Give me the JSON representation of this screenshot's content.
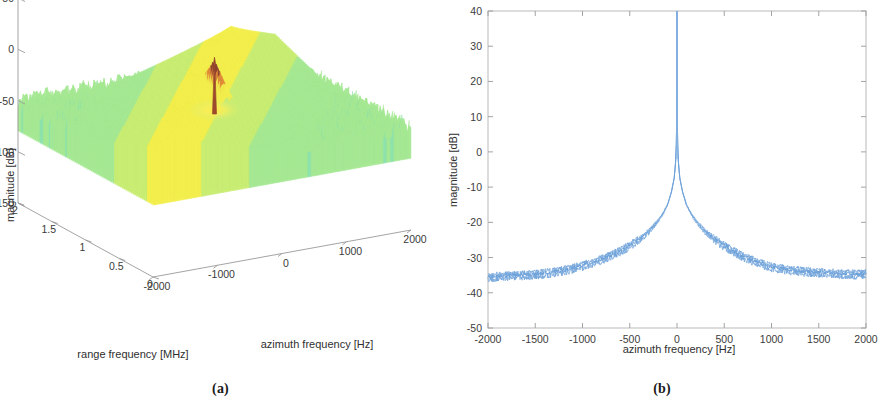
{
  "figure": {
    "panels": [
      {
        "id": "a",
        "caption": "(a)"
      },
      {
        "id": "b",
        "caption": "(b)"
      }
    ]
  },
  "chart_data": [
    {
      "type": "surface",
      "panel": "a",
      "title": "",
      "xlabel": "azimuth frequency [Hz]",
      "ylabel": "range frequency [MHz]",
      "zlabel": "magnitude [dB]",
      "xticks": [
        -2000,
        -1000,
        0,
        1000,
        2000
      ],
      "xticklabels": [
        "-2000",
        "-1000",
        "0",
        "1000",
        "2000"
      ],
      "yticks": [
        2,
        1.5,
        1,
        0.5,
        0
      ],
      "yticklabels": [
        "2",
        "1.5",
        "1",
        "0.5",
        "0"
      ],
      "zticks": [
        50,
        0,
        -50,
        -100,
        -150
      ],
      "zticklabels": [
        "50",
        "0",
        "-50",
        "-100",
        "-150"
      ],
      "xlim": [
        -2000,
        2000
      ],
      "ylim": [
        0,
        2
      ],
      "zlim": [
        -150,
        50
      ],
      "grid": false,
      "legend": "none",
      "colormap": [
        "#6fe0d6",
        "#9ce89a",
        "#b8ec7e",
        "#eff05e",
        "#f0b24a",
        "#8a4030"
      ],
      "annotations": [
        "noise floor near -50 dB across the surface",
        "bright yellow ridge along azimuth frequency",
        "sharp spike near 0 Hz reaching about 0 dB"
      ],
      "surface": {
        "noise_floor_db": -50,
        "ridge_peak_db": -15,
        "spike_peak_db": 5,
        "spike_x_hz": 0,
        "spike_y_mhz": 1.0
      }
    },
    {
      "type": "line",
      "panel": "b",
      "title": "",
      "xlabel": "azimuth frequency [Hz]",
      "ylabel": "magnitude [dB]",
      "xticks": [
        -2000,
        -1500,
        -1000,
        -500,
        0,
        500,
        1000,
        1500,
        2000
      ],
      "xticklabels": [
        "-2000",
        "-1500",
        "-1000",
        "-500",
        "0",
        "500",
        "1000",
        "1500",
        "2000"
      ],
      "yticks": [
        40,
        30,
        20,
        10,
        0,
        -10,
        -20,
        -30,
        -40,
        -50
      ],
      "yticklabels": [
        "40",
        "30",
        "20",
        "10",
        "0",
        "-10",
        "-20",
        "-30",
        "-40",
        "-50"
      ],
      "xlim": [
        -2000,
        2000
      ],
      "ylim": [
        -50,
        40
      ],
      "grid": false,
      "legend": "none",
      "series": [
        {
          "name": "azimuth spectrum",
          "color": "#6a9fd8",
          "x": [
            -2000,
            -1900,
            -1800,
            -1700,
            -1600,
            -1500,
            -1400,
            -1300,
            -1200,
            -1100,
            -1000,
            -900,
            -800,
            -700,
            -600,
            -500,
            -400,
            -300,
            -200,
            -150,
            -100,
            -60,
            -30,
            -15,
            -6,
            -2,
            0,
            2,
            6,
            15,
            30,
            60,
            100,
            150,
            200,
            300,
            400,
            500,
            600,
            700,
            800,
            900,
            1000,
            1100,
            1200,
            1300,
            1400,
            1500,
            1600,
            1700,
            1800,
            1900,
            2000
          ],
          "values": [
            -35.5,
            -35.3,
            -35.2,
            -35.0,
            -34.9,
            -34.7,
            -34.4,
            -34.1,
            -33.6,
            -33.0,
            -32.2,
            -31.4,
            -30.5,
            -29.4,
            -28.1,
            -26.6,
            -24.8,
            -22.6,
            -19.6,
            -17.6,
            -15.0,
            -11.5,
            -7.5,
            -3.0,
            3.0,
            13.0,
            40.0,
            13.0,
            3.0,
            -3.0,
            -7.5,
            -11.5,
            -15.0,
            -17.6,
            -19.6,
            -22.6,
            -24.8,
            -26.6,
            -28.2,
            -29.6,
            -30.8,
            -31.8,
            -32.6,
            -33.1,
            -33.5,
            -33.8,
            -34.0,
            -34.2,
            -34.3,
            -34.5,
            -34.6,
            -34.7,
            -34.5
          ],
          "noise_amplitude_db": 1.4
        }
      ],
      "annotations": [
        "peak at 0 Hz clipped at top of axis (above 40 dB)",
        "noise floor about -35 dB at the band edges"
      ]
    }
  ]
}
